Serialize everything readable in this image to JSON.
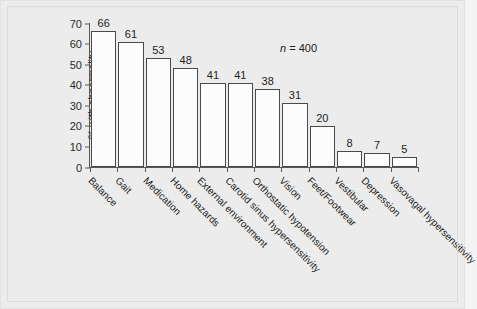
{
  "chart_data": {
    "type": "bar",
    "title": "",
    "subtitle": "",
    "xlabel": "",
    "ylabel": "% with abnormality",
    "ylim": [
      0,
      70
    ],
    "ytick_step": 10,
    "yticks": [
      0,
      10,
      20,
      30,
      40,
      50,
      60,
      70
    ],
    "grid": false,
    "legend": false,
    "legend_position": "none",
    "show_value_labels": true,
    "categories": [
      "Balance",
      "Gait",
      "Medication",
      "Home hazards",
      "External environment",
      "Carotid sinus hypersensitivity",
      "Orthostatic hypotension",
      "Vision",
      "Feet/Footwear",
      "Vestibular",
      "Depression",
      "Vasovagal hypersensitivity"
    ],
    "values": [
      66,
      61,
      53,
      48,
      41,
      41,
      38,
      31,
      20,
      8,
      7,
      5
    ],
    "annotations": [
      {
        "symbol": "n",
        "text": " = 400"
      }
    ],
    "colors": {
      "bar_fill": "#fcfcfc",
      "bar_edge": "#4a4a4a",
      "axis": "#58585a",
      "text": "#232323",
      "background": "#ececec"
    }
  }
}
